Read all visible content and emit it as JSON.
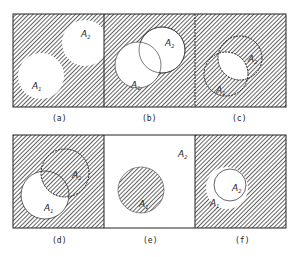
{
  "figure": {
    "colors": {
      "hatch": "#3a3a3a",
      "background": "#ffffff",
      "line": "#222222"
    },
    "panels": [
      {
        "id": "a",
        "caption": "(a)",
        "labels": [
          "A1",
          "A2"
        ],
        "label_base": "A",
        "subs": [
          "1",
          "2"
        ]
      },
      {
        "id": "b",
        "caption": "(b)",
        "labels": [
          "A1",
          "A2"
        ],
        "label_base": "A",
        "subs": [
          "1",
          "2"
        ]
      },
      {
        "id": "c",
        "caption": "(c)",
        "labels": [
          "A1",
          "A2"
        ],
        "label_base": "A",
        "subs": [
          "1",
          "2"
        ]
      },
      {
        "id": "d",
        "caption": "(d)",
        "labels": [
          "A1",
          "A2"
        ],
        "label_base": "A",
        "subs": [
          "1",
          "2"
        ]
      },
      {
        "id": "e",
        "caption": "(e)",
        "labels": [
          "A1",
          "A2"
        ],
        "label_base": "A",
        "subs": [
          "1",
          "2"
        ]
      },
      {
        "id": "f",
        "caption": "(f)",
        "labels": [
          "A1",
          "A2"
        ],
        "label_base": "A",
        "subs": [
          "1",
          "2"
        ]
      }
    ]
  }
}
